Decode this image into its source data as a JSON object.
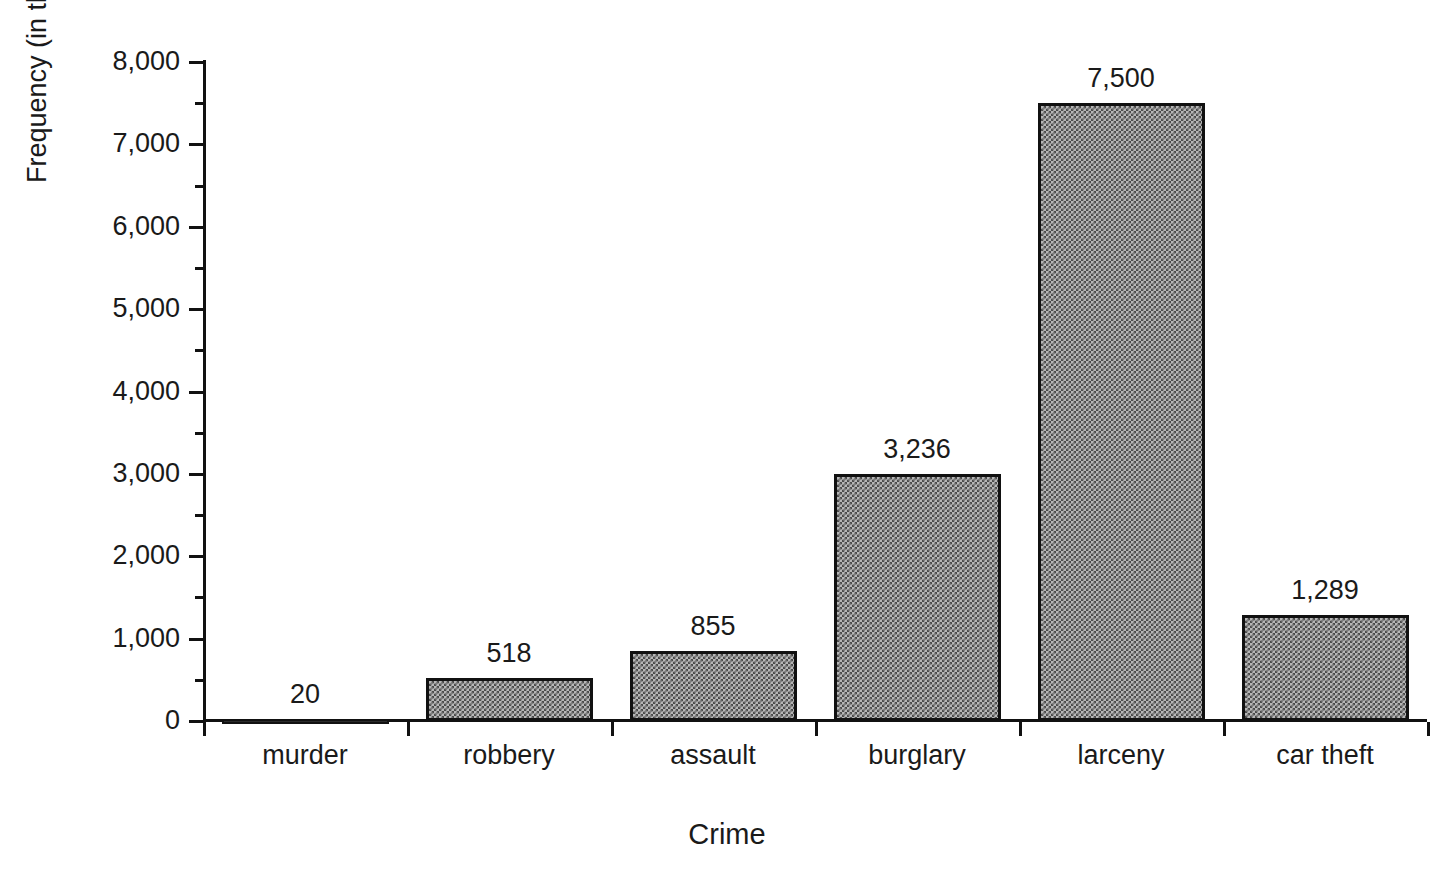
{
  "chart_data": {
    "type": "bar",
    "title": "",
    "xlabel": "Crime",
    "ylabel": "Frequency (in thousands)",
    "categories": [
      "murder",
      "robbery",
      "assault",
      "burglary",
      "larceny",
      "car theft"
    ],
    "values": [
      20,
      518,
      855,
      3236,
      7500,
      1289
    ],
    "value_labels": [
      "20",
      "518",
      "855",
      "3,236",
      "7,500",
      "1,289"
    ],
    "ylim": [
      0,
      8000
    ],
    "ytick_values": [
      0,
      1000,
      2000,
      3000,
      4000,
      5000,
      6000,
      7000,
      8000
    ],
    "ytick_labels": [
      "0",
      "1,000",
      "2,000",
      "3,000",
      "4,000",
      "5,000",
      "6,000",
      "7,000",
      "8,000"
    ],
    "yminor_values": [
      500,
      1500,
      2500,
      3500,
      4500,
      5500,
      6500,
      7500
    ],
    "grid": false,
    "legend": false,
    "bar_fill": "#b6b6b6",
    "bar_pattern": "checkerboard-halftone",
    "bar_border": "#111111",
    "background": "#ffffff"
  },
  "axis": {
    "x_title": "Crime",
    "y_title": "Frequency (in thousands)"
  }
}
